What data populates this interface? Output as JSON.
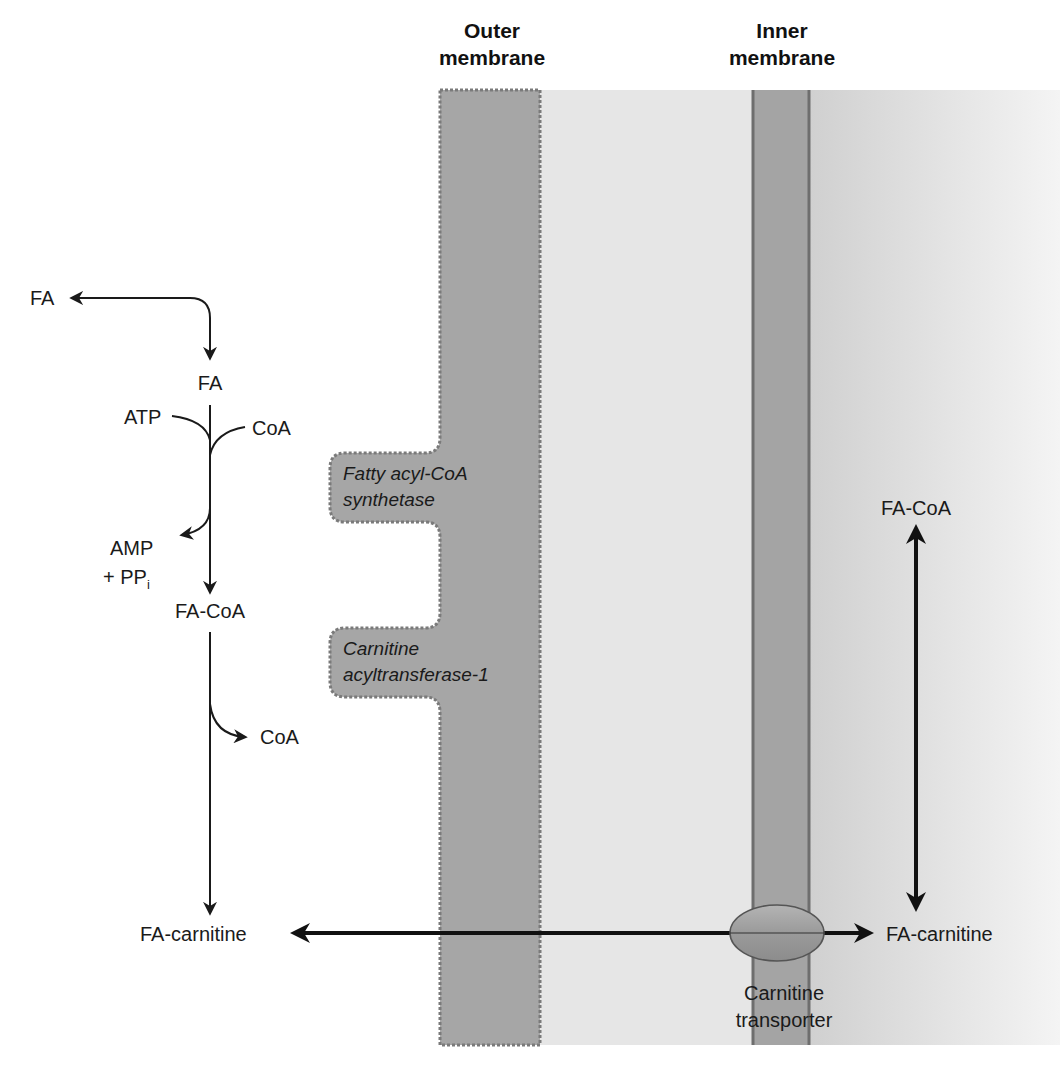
{
  "figure": {
    "colors": {
      "background": "#ffffff",
      "outer_membrane": "#a6a6a6",
      "outer_membrane_edge": "#7a7a7a",
      "intermembrane_space": "#e6e6e6",
      "inner_membrane": "#a4a4a4",
      "inner_membrane_edge": "#6e6e6e",
      "matrix_left": "#d2d2d2",
      "matrix_right": "#f2f2f2",
      "transporter": "#9a9a9a",
      "arrow": "#1a1a1a"
    }
  },
  "headers": {
    "outer_membrane": {
      "line1": "Outer",
      "line2": "membrane"
    },
    "inner_membrane": {
      "line1": "Inner",
      "line2": "membrane"
    }
  },
  "cytosol": {
    "fa_top": "FA",
    "fa": "FA",
    "atp": "ATP",
    "coa_in": "CoA",
    "amp": "AMP",
    "ppi_prefix": "+ PP",
    "ppi_sub": "i",
    "fa_coa": "FA-CoA",
    "coa_out": "CoA",
    "fa_carnitine": "FA-carnitine"
  },
  "enzymes": {
    "acyl_coa_synthetase": {
      "line1": "Fatty acyl-CoA",
      "line2": "synthetase"
    },
    "cat1": {
      "line1": "Carnitine",
      "line2": "acyltransferase-1"
    }
  },
  "matrix": {
    "fa_coa": "FA-CoA",
    "fa_carnitine": "FA-carnitine"
  },
  "transporter": {
    "line1": "Carnitine",
    "line2": "transporter"
  }
}
